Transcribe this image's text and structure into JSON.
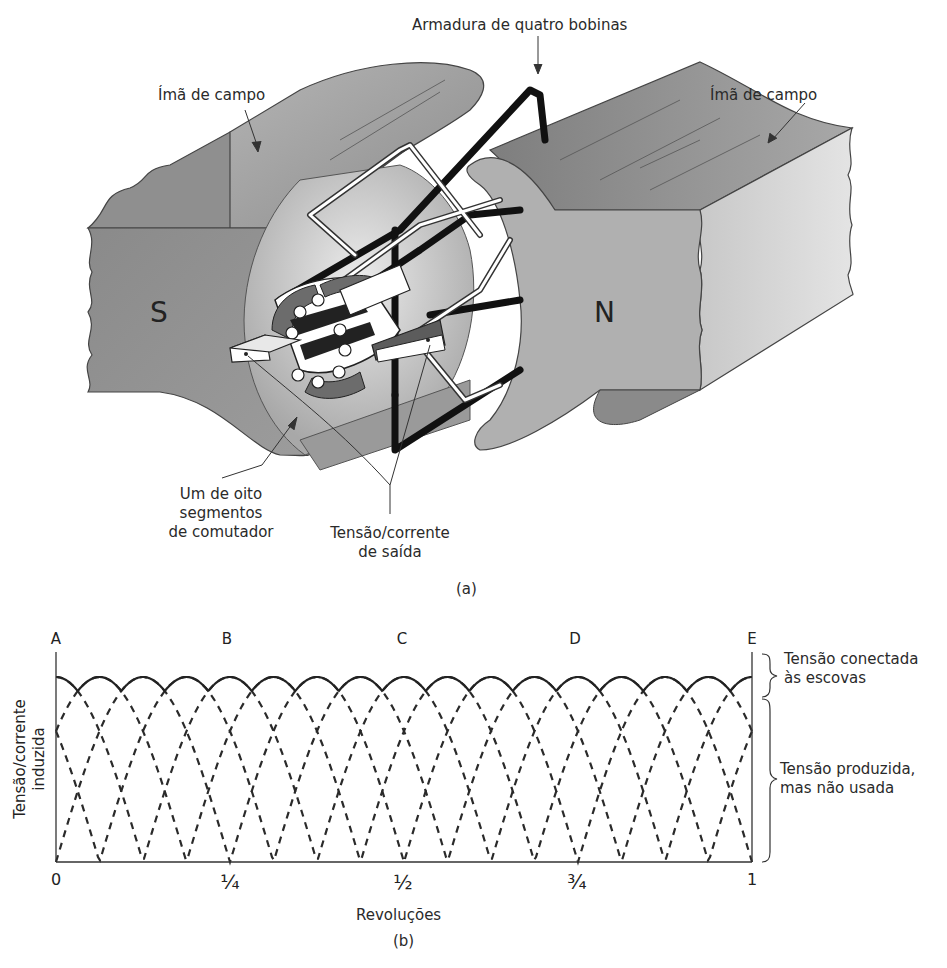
{
  "figure_a": {
    "caption": "(a)",
    "labels": {
      "armature": "Armadura de quatro bobinas",
      "field_magnet_left": "Ímã de campo",
      "field_magnet_right": "Ímã de campo",
      "commutator_line1": "Um de oito",
      "commutator_line2": "segmentos",
      "commutator_line3": "de comutador",
      "output_line1": "Tensão/corrente",
      "output_line2": "de saída"
    },
    "poles": {
      "left": "S",
      "right": "N"
    }
  },
  "figure_b": {
    "caption": "(b)",
    "points": [
      "A",
      "B",
      "C",
      "D",
      "E"
    ],
    "x_ticks": [
      "0",
      "¼",
      "½",
      "¾",
      "1"
    ],
    "xlabel": "Revoluções",
    "ylabel_line1": "Tensão/corrente",
    "ylabel_line2": "induzida",
    "brace_top_line1": "Tensão conectada",
    "brace_top_line2": "às escovas",
    "brace_bottom_line1": "Tensão produzida,",
    "brace_bottom_line2": "mas não usada"
  },
  "chart_data": {
    "type": "line",
    "title": "",
    "xlabel": "Revoluções",
    "ylabel": "Tensão/corrente induzida",
    "x_ticks": [
      "0",
      "1/4",
      "1/2",
      "3/4",
      "1"
    ],
    "xlim": [
      0,
      1
    ],
    "ylim": [
      0,
      1
    ],
    "point_labels": [
      {
        "label": "A",
        "x": 0
      },
      {
        "label": "B",
        "x": 0.25
      },
      {
        "label": "C",
        "x": 0.5
      },
      {
        "label": "D",
        "x": 0.75
      },
      {
        "label": "E",
        "x": 1
      }
    ],
    "series": [
      {
        "name": "Tensão conectada às escovas (envelope, solid)",
        "style": "solid",
        "x": [
          0,
          0.0625,
          0.125,
          0.1875,
          0.25,
          0.3125,
          0.375,
          0.4375,
          0.5,
          0.5625,
          0.625,
          0.6875,
          0.75,
          0.8125,
          0.875,
          0.9375,
          1
        ],
        "values": [
          0.92,
          0.85,
          1.0,
          0.85,
          1.0,
          0.85,
          1.0,
          0.85,
          1.0,
          0.85,
          1.0,
          0.85,
          1.0,
          0.85,
          1.0,
          0.85,
          0.92
        ]
      },
      {
        "name": "Bobina 1 (dashed)",
        "style": "dashed",
        "description": "|sin| humps, period 1/8 rev... each of 4 coils offset by 1/32 rev",
        "zeros": [
          0,
          0.1875,
          0.375,
          0.5625,
          0.75,
          0.9375
        ]
      },
      {
        "name": "Bobina 2 (dashed)",
        "style": "dashed",
        "zeros": [
          0.0,
          0.125,
          0.3125,
          0.5,
          0.6875,
          0.875
        ]
      },
      {
        "name": "Tensão produzida, mas não usada (dashed)",
        "style": "dashed"
      }
    ],
    "annotations": [
      "Tensão conectada às escovas",
      "Tensão produzida, mas não usada"
    ],
    "grid": false,
    "legend": "none"
  }
}
